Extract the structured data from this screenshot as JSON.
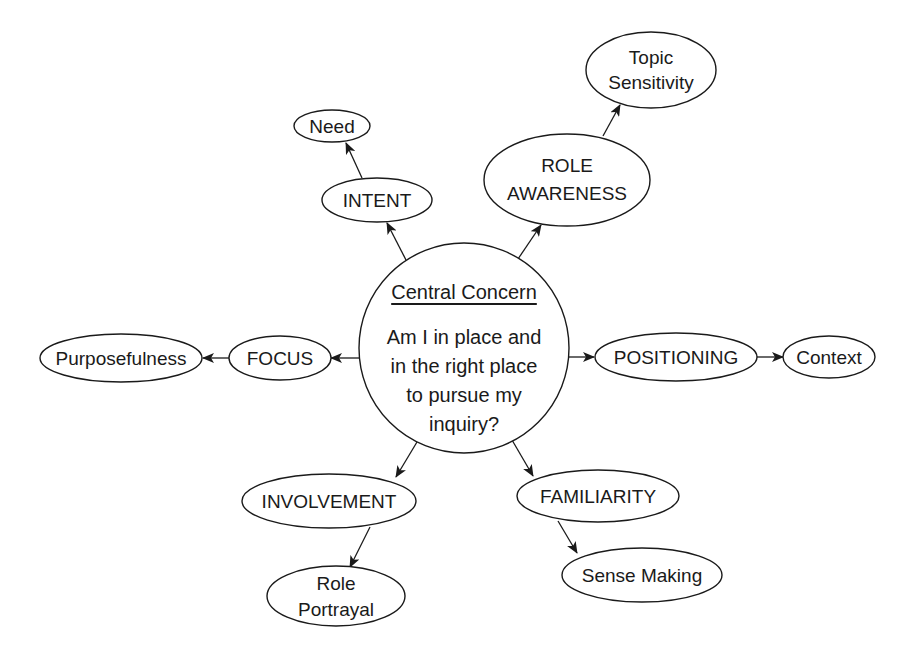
{
  "diagram": {
    "type": "concept-map",
    "colors": {
      "stroke": "#1a1a1a",
      "fill": "#ffffff",
      "text": "#1a1a1a"
    },
    "center": {
      "title": "Central Concern",
      "lines": [
        "Am I in place and",
        "in the right place",
        "to pursue my",
        "inquiry?"
      ]
    },
    "nodes": {
      "intent": {
        "lines": [
          "INTENT"
        ]
      },
      "need": {
        "lines": [
          "Need"
        ]
      },
      "role_awareness": {
        "lines": [
          "ROLE",
          "AWARENESS"
        ]
      },
      "topic_sensitivity": {
        "lines": [
          "Topic",
          "Sensitivity"
        ]
      },
      "focus": {
        "lines": [
          "FOCUS"
        ]
      },
      "purposefulness": {
        "lines": [
          "Purposefulness"
        ]
      },
      "positioning": {
        "lines": [
          "POSITIONING"
        ]
      },
      "context": {
        "lines": [
          "Context"
        ]
      },
      "involvement": {
        "lines": [
          "INVOLVEMENT"
        ]
      },
      "role_portrayal": {
        "lines": [
          "Role",
          "Portrayal"
        ]
      },
      "familiarity": {
        "lines": [
          "FAMILIARITY"
        ]
      },
      "sense_making": {
        "lines": [
          "Sense Making"
        ]
      }
    },
    "edges": [
      {
        "from": "Central Concern",
        "to": "INTENT"
      },
      {
        "from": "INTENT",
        "to": "Need"
      },
      {
        "from": "Central Concern",
        "to": "ROLE AWARENESS"
      },
      {
        "from": "ROLE AWARENESS",
        "to": "Topic Sensitivity"
      },
      {
        "from": "Central Concern",
        "to": "FOCUS"
      },
      {
        "from": "FOCUS",
        "to": "Purposefulness"
      },
      {
        "from": "Central Concern",
        "to": "POSITIONING"
      },
      {
        "from": "POSITIONING",
        "to": "Context"
      },
      {
        "from": "Central Concern",
        "to": "INVOLVEMENT"
      },
      {
        "from": "INVOLVEMENT",
        "to": "Role Portrayal"
      },
      {
        "from": "Central Concern",
        "to": "FAMILIARITY"
      },
      {
        "from": "FAMILIARITY",
        "to": "Sense Making"
      }
    ]
  }
}
